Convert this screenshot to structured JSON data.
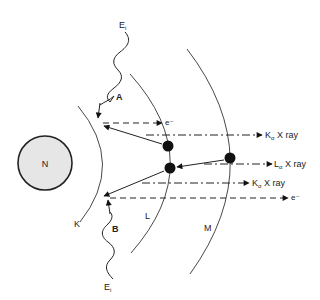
{
  "diagram": {
    "type": "atomic shell diagram",
    "nucleus": {
      "label": "N",
      "cx": 45,
      "cy": 163,
      "r": 27,
      "fill": "#e6e6e6"
    },
    "shells": [
      {
        "label": "K",
        "label_x": 74,
        "label_y": 223
      },
      {
        "label": "L",
        "label_x": 147,
        "label_y": 219
      },
      {
        "label": "M",
        "label_x": 204,
        "label_y": 231
      }
    ],
    "incident_photons": [
      {
        "energy_label": "E",
        "energy_subscript": "i",
        "event_label": "A"
      },
      {
        "energy_label": "E",
        "energy_subscript": "i",
        "event_label": "B"
      }
    ],
    "emissions": [
      {
        "label": "e⁻",
        "kind": "electron",
        "y": 123
      },
      {
        "label_main": "K",
        "label_sub": "α",
        "label_tail": " X ray",
        "kind": "xray",
        "y": 135
      },
      {
        "label_main": "L",
        "label_sub": "α",
        "label_tail": " X ray",
        "kind": "xray",
        "y": 164
      },
      {
        "label_main": "K",
        "label_sub": "α",
        "label_tail": " X ray",
        "kind": "xray",
        "y": 183
      },
      {
        "label": "e⁻",
        "kind": "electron",
        "y": 198
      }
    ],
    "colors": {
      "line": "#222222",
      "nucleus_fill": "#e6e6e6",
      "electron": "#111111"
    }
  }
}
